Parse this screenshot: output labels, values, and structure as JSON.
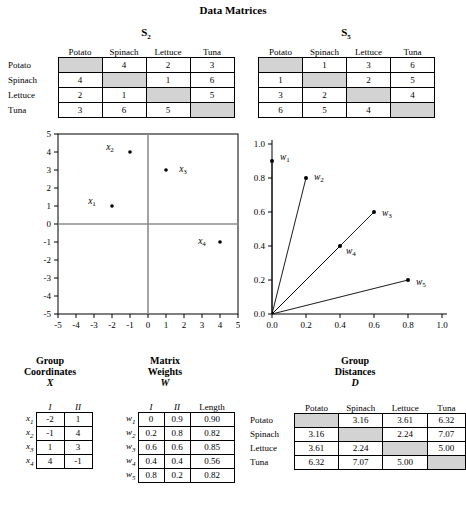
{
  "title": "Data Matrices",
  "matrix_s2": {
    "title": "S2",
    "title_base": "S",
    "title_sub": "2",
    "columns": [
      "Potato",
      "Spinach",
      "Lettuce",
      "Tuna"
    ],
    "rows": [
      "Potato",
      "Spinach",
      "Lettuce",
      "Tuna"
    ],
    "cells": [
      [
        "",
        "4",
        "2",
        "3"
      ],
      [
        "4",
        "",
        "1",
        "6"
      ],
      [
        "2",
        "1",
        "",
        "5"
      ],
      [
        "3",
        "6",
        "5",
        ""
      ]
    ]
  },
  "matrix_s5": {
    "title": "S5",
    "title_base": "S",
    "title_sub": "5",
    "columns": [
      "Potato",
      "Spinach",
      "Lettuce",
      "Tuna"
    ],
    "cells": [
      [
        "",
        "1",
        "3",
        "6"
      ],
      [
        "1",
        "",
        "2",
        "5"
      ],
      [
        "3",
        "2",
        "",
        "4"
      ],
      [
        "6",
        "5",
        "4",
        ""
      ]
    ]
  },
  "plot_left": {
    "xlabels": [
      "-5",
      "-4",
      "-3",
      "-2",
      "-1",
      "0",
      "1",
      "2",
      "3",
      "4",
      "5"
    ],
    "ylabels": [
      "5",
      "4",
      "3",
      "2",
      "1",
      "0",
      "-1",
      "-2",
      "-3",
      "-4",
      "-5"
    ],
    "xmin": -5,
    "xmax": 5,
    "ymin": -5,
    "ymax": 5,
    "points": [
      {
        "label": "x1",
        "base": "x",
        "sub": "1",
        "x": -2,
        "y": 1
      },
      {
        "label": "x2",
        "base": "x",
        "sub": "2",
        "x": -1,
        "y": 4
      },
      {
        "label": "x3",
        "base": "x",
        "sub": "3",
        "x": 1,
        "y": 3
      },
      {
        "label": "x4",
        "base": "x",
        "sub": "4",
        "x": 4,
        "y": -1
      }
    ]
  },
  "plot_right": {
    "xlabels": [
      "0.0",
      "0.2",
      "0.4",
      "0.6",
      "0.8",
      "1.0"
    ],
    "ylabels": [
      "0.0",
      "0.2",
      "0.4",
      "0.6",
      "0.8",
      "1.0"
    ],
    "xmin": 0,
    "xmax": 1,
    "ymin": 0,
    "ymax": 1,
    "vectors": [
      {
        "label": "w1",
        "base": "w",
        "sub": "1",
        "x": 0.0,
        "y": 0.9
      },
      {
        "label": "w2",
        "base": "w",
        "sub": "2",
        "x": 0.2,
        "y": 0.8
      },
      {
        "label": "w3",
        "base": "w",
        "sub": "3",
        "x": 0.6,
        "y": 0.6
      },
      {
        "label": "w4",
        "base": "w",
        "sub": "4",
        "x": 0.4,
        "y": 0.4
      },
      {
        "label": "w5",
        "base": "w",
        "sub": "5",
        "x": 0.8,
        "y": 0.2
      }
    ]
  },
  "group_coordinates": {
    "title_line1": "Group",
    "title_line2": "Coordinates",
    "title_line3": "X",
    "columns": [
      "I",
      "II"
    ],
    "rows": [
      {
        "label": "x1",
        "base": "x",
        "sub": "1",
        "values": [
          "-2",
          "1"
        ]
      },
      {
        "label": "x2",
        "base": "x",
        "sub": "2",
        "values": [
          "-1",
          "4"
        ]
      },
      {
        "label": "x3",
        "base": "x",
        "sub": "3",
        "values": [
          "1",
          "3"
        ]
      },
      {
        "label": "x4",
        "base": "x",
        "sub": "4",
        "values": [
          "4",
          "-1"
        ]
      }
    ]
  },
  "matrix_weights": {
    "title_line1": "Matrix",
    "title_line2": "Weights",
    "title_line3": "W",
    "columns": [
      "I",
      "II",
      "Length"
    ],
    "rows": [
      {
        "label": "w1",
        "base": "w",
        "sub": "1",
        "values": [
          "0",
          "0.9",
          "0.90"
        ]
      },
      {
        "label": "w2",
        "base": "w",
        "sub": "2",
        "values": [
          "0.2",
          "0.8",
          "0.82"
        ]
      },
      {
        "label": "w3",
        "base": "w",
        "sub": "3",
        "values": [
          "0.6",
          "0.6",
          "0.85"
        ]
      },
      {
        "label": "w4",
        "base": "w",
        "sub": "4",
        "values": [
          "0.4",
          "0.4",
          "0.56"
        ]
      },
      {
        "label": "w5",
        "base": "w",
        "sub": "5",
        "values": [
          "0.8",
          "0.2",
          "0.82"
        ]
      }
    ]
  },
  "group_distances": {
    "title_line1": "Group",
    "title_line2": "Distances",
    "title_line3": "D",
    "columns": [
      "Potato",
      "Spinach",
      "Lettuce",
      "Tuna"
    ],
    "rows": [
      "Potato",
      "Spinach",
      "Lettuce",
      "Tuna"
    ],
    "cells": [
      [
        "",
        "3.16",
        "3.61",
        "6.32"
      ],
      [
        "3.16",
        "",
        "2.24",
        "7.07"
      ],
      [
        "3.61",
        "2.24",
        "",
        "5.00"
      ],
      [
        "6.32",
        "7.07",
        "5.00",
        ""
      ]
    ]
  },
  "colors": {
    "shade": "#d3d3d3",
    "line": "#000000",
    "axis": "#808080"
  }
}
